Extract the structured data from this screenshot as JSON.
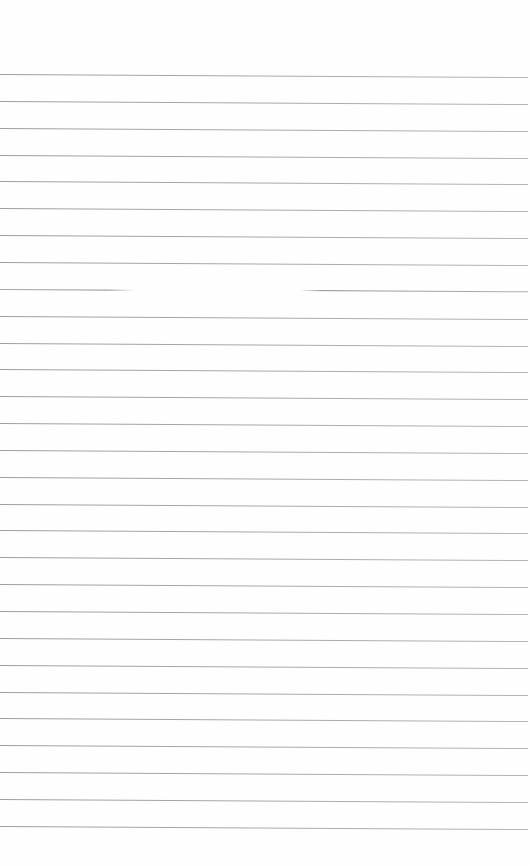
{
  "document": {
    "type": "lined-paper",
    "background_color": "#fefefe",
    "line_color": "#9a9a9a",
    "line_count": 29,
    "first_line_y": 74,
    "line_spacing": 26.85,
    "broken_line": {
      "index": 8,
      "gap_start_x": 135,
      "gap_end_x": 300
    },
    "text_content": ""
  }
}
